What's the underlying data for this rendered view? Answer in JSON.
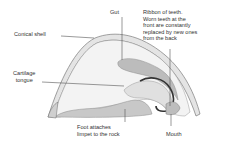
{
  "diagram": {
    "labels": {
      "gut": "Gut",
      "ribbon": "Ribbon of teeth.\nWorn teeth at the\nfront are constantly\nreplaced by new ones\nfrom the back",
      "shell": "Conical shell",
      "cartilage": "Cartilage\ntongue",
      "foot": "Foot attaches\nlimpet to the rock",
      "mouth": "Mouth"
    },
    "colors": {
      "shell_fill": "#e9e9e9",
      "shell_outline": "#7a7a7a",
      "body_fill": "#f3f3f3",
      "foot_fill": "#c9c9c9",
      "gut_fill": "#bdbdbd",
      "teeth": "#3a3a3a",
      "leader": "#555555"
    }
  }
}
